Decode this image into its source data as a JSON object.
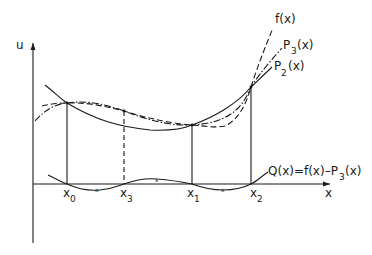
{
  "figure": {
    "axes": {
      "y_label": "u",
      "x_label": "x"
    },
    "curves": {
      "f": {
        "label": "f(x)",
        "style": "dashed"
      },
      "P3": {
        "label_main": "P",
        "label_sub": "3",
        "label_tail": "(x)",
        "style": "dash-dot"
      },
      "P2": {
        "label_main": "P",
        "label_sub": "2",
        "label_tail": "(x)",
        "style": "solid"
      },
      "Q": {
        "label_main": "Q(x)=f(x)–P",
        "label_sub": "3",
        "label_tail": "(x)",
        "style": "solid"
      }
    },
    "nodes": [
      {
        "main": "x",
        "sub": "0"
      },
      {
        "main": "x",
        "sub": "3"
      },
      {
        "main": "x",
        "sub": "1"
      },
      {
        "main": "x",
        "sub": "2"
      }
    ],
    "colors": {
      "ink": "#1a1a1a",
      "background": "#ffffff"
    }
  }
}
